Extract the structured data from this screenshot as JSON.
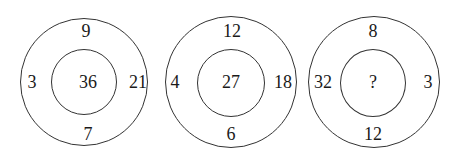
{
  "puzzle": {
    "circles": [
      {
        "top": "9",
        "left": "3",
        "right": "21",
        "bottom": "7",
        "center": "36"
      },
      {
        "top": "12",
        "left": "4",
        "right": "18",
        "bottom": "6",
        "center": "27"
      },
      {
        "top": "8",
        "left": "32",
        "right": "3",
        "bottom": "12",
        "center": "?"
      }
    ]
  },
  "colors": {
    "stroke": "#333333",
    "text": "#1a1a1a",
    "background": "#ffffff"
  }
}
